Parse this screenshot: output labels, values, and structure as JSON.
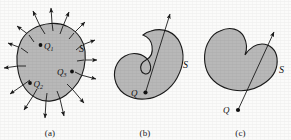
{
  "figure": {
    "background_color": "#fbfbfa",
    "blob_fill_color": "#b8b8b8",
    "line_color": "#1a1a1a"
  },
  "panels": [
    {
      "id": "a",
      "caption": "(a)",
      "surface_label": "S",
      "charges": [
        {
          "label": "Q",
          "subscript": "1",
          "x": 47,
          "y": 45,
          "dot_side": "left"
        },
        {
          "label": "Q",
          "subscript": "2",
          "x": 36,
          "y": 83,
          "dot_side": "left"
        },
        {
          "label": "Q",
          "subscript": "3",
          "x": 66,
          "y": 72,
          "dot_side": "right"
        }
      ],
      "flux_arrow_count": 14,
      "flux_direction": "outward"
    },
    {
      "id": "b",
      "caption": "(b)",
      "surface_label": "S",
      "charges": [
        {
          "label": "Q",
          "subscript": "",
          "x": 140,
          "y": 98,
          "dot_side": "right"
        }
      ],
      "flux_arrow_count": 1,
      "flux_direction": "outward"
    },
    {
      "id": "c",
      "caption": "(c)",
      "surface_label": "S",
      "charges": [
        {
          "label": "Q",
          "subscript": "",
          "x": 228,
          "y": 110,
          "dot_side": "right"
        }
      ],
      "flux_arrow_count": 1,
      "flux_direction": "through"
    }
  ]
}
